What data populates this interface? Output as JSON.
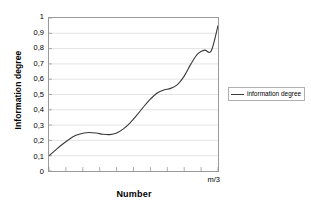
{
  "chart_data": {
    "type": "line",
    "title": "",
    "xlabel": "Number",
    "ylabel": "Information degree",
    "ylim": [
      0,
      1
    ],
    "grid": "horizontal",
    "legend_position": "right",
    "y_ticks": [
      "1",
      "0,9",
      "0,8",
      "0,7",
      "0,6",
      "0,5",
      "0,4",
      "0,3",
      "0,2",
      "0,1",
      "0"
    ],
    "y_tick_values": [
      1,
      0.9,
      0.8,
      0.7,
      0.6,
      0.5,
      0.4,
      0.3,
      0.2,
      0.1,
      0
    ],
    "x_tick_count": 10,
    "x_tick_labels": [],
    "x_end_annotation": "m/3",
    "series": [
      {
        "name": "information degree",
        "color": "#3a3a3a",
        "x": [
          0.0,
          0.04,
          0.08,
          0.12,
          0.16,
          0.2,
          0.24,
          0.28,
          0.32,
          0.36,
          0.4,
          0.44,
          0.48,
          0.52,
          0.56,
          0.6,
          0.64,
          0.68,
          0.72,
          0.76,
          0.8,
          0.84,
          0.88,
          0.92,
          0.96,
          1.0
        ],
        "values": [
          0.1,
          0.138,
          0.175,
          0.208,
          0.233,
          0.247,
          0.252,
          0.248,
          0.24,
          0.238,
          0.248,
          0.275,
          0.315,
          0.365,
          0.42,
          0.47,
          0.51,
          0.53,
          0.54,
          0.565,
          0.62,
          0.7,
          0.765,
          0.79,
          0.785,
          0.95
        ]
      }
    ]
  },
  "legend": {
    "entries": [
      {
        "label": "information degree"
      }
    ]
  },
  "axes": {
    "y_title": "Information degree",
    "x_title": "Number",
    "x_end_label": "m/3"
  }
}
